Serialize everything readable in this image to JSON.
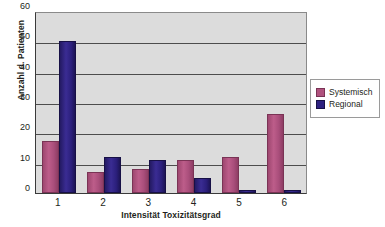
{
  "chart_data": {
    "type": "bar",
    "title": "",
    "xlabel": "Intensität Toxizitätsgrad",
    "ylabel": "Anzahl d. Patienten",
    "categories": [
      "1",
      "2",
      "3",
      "4",
      "5",
      "6"
    ],
    "series": [
      {
        "name": "Systemisch",
        "color": "#b0527e",
        "values": [
          17,
          7,
          8,
          11,
          12,
          26
        ]
      },
      {
        "name": "Regional",
        "color": "#2d2080",
        "values": [
          50,
          12,
          11,
          5,
          1,
          1
        ]
      }
    ],
    "ylim": [
      0,
      60
    ],
    "yticks": [
      60,
      50,
      40,
      30,
      20,
      10,
      0
    ],
    "grid": true,
    "legend_position": "right",
    "plot_background": "#dcdcdc",
    "gridline_color": "#4d4d4d"
  },
  "legend": {
    "items": [
      {
        "label": "Systemisch"
      },
      {
        "label": "Regional"
      }
    ]
  }
}
